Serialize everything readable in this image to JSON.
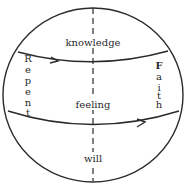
{
  "diagram": {
    "labels": {
      "top": "knowledge",
      "middle": "feeling",
      "bottom": "will"
    },
    "left_vertical": [
      "R",
      "e",
      "p",
      "e",
      "n",
      "t"
    ],
    "right_vertical": [
      "F",
      "a",
      "i",
      "t",
      "h"
    ],
    "left_word": "Repent",
    "right_word": "Faith",
    "colors": {
      "stroke": "#2a2a2a",
      "background": "#ffffff"
    }
  }
}
